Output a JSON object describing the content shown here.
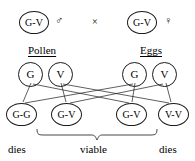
{
  "diagram": {
    "stroke_color": "#1a1a1a",
    "background_color": "#ffffff",
    "cross_symbol": "×",
    "parents": [
      {
        "genotype": "G-V",
        "sex_symbol": "♂",
        "sex_name": "male"
      },
      {
        "genotype": "G-V",
        "sex_symbol": "♀",
        "sex_name": "female"
      }
    ],
    "gamete_groups": [
      {
        "label": "Pollen",
        "gametes": [
          {
            "allele": "G"
          },
          {
            "allele": "V"
          }
        ]
      },
      {
        "label": "Eggs",
        "gametes": [
          {
            "allele": "G"
          },
          {
            "allele": "V"
          }
        ]
      }
    ],
    "offspring": [
      {
        "genotype": "G-G",
        "fate": "dies"
      },
      {
        "genotype": "G-V",
        "fate": "viable"
      },
      {
        "genotype": "G-V",
        "fate": "viable"
      },
      {
        "genotype": "V-V",
        "fate": "dies"
      }
    ],
    "fate_labels": [
      {
        "text": "dies"
      },
      {
        "text": "viable"
      },
      {
        "text": "dies"
      }
    ]
  }
}
